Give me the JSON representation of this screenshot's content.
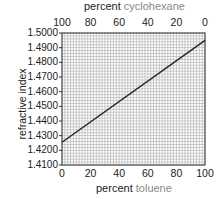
{
  "chart_data": {
    "type": "line",
    "title": "",
    "xlabel": "percent toluene",
    "xlabel_parts": {
      "bold": "percent",
      "light": "toluene"
    },
    "x2label": "percent cyclohexane",
    "x2label_parts": {
      "bold": "percent",
      "light": "cyclohexane"
    },
    "ylabel": "refractive index",
    "xlim": [
      0,
      100
    ],
    "x2lim": [
      100,
      0
    ],
    "ylim": [
      1.41,
      1.5
    ],
    "x_ticks": [
      "0",
      "20",
      "40",
      "60",
      "80",
      "100"
    ],
    "x2_ticks": [
      "100",
      "80",
      "60",
      "40",
      "20",
      "0"
    ],
    "y_ticks": [
      "1.4100",
      "1.4200",
      "1.4300",
      "1.4400",
      "1.4500",
      "1.4600",
      "1.4700",
      "1.4800",
      "1.4900",
      "1.5000"
    ],
    "grid": true,
    "series": [
      {
        "name": "refractive index vs composition",
        "x": [
          0,
          100
        ],
        "y": [
          1.4255,
          1.495
        ],
        "color": "#222222"
      }
    ]
  }
}
